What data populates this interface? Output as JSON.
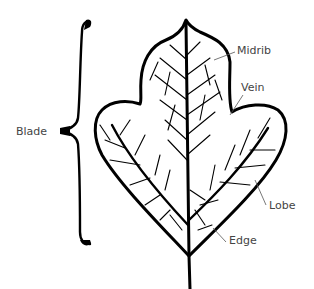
{
  "diagram": {
    "labels": {
      "blade": "Blade",
      "midrib": "Midrib",
      "vein": "Vein",
      "lobe": "Lobe",
      "edge": "Edge"
    },
    "colors": {
      "ink": "#000000",
      "label_text": "#444444",
      "leader_line": "#555555",
      "background": "#ffffff"
    }
  }
}
